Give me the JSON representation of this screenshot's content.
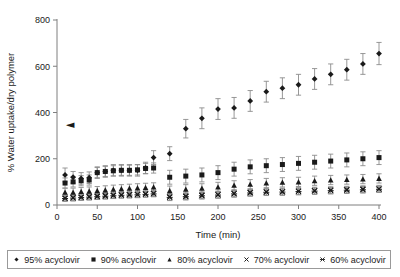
{
  "chart_data": {
    "type": "scatter",
    "title": "",
    "xlabel": "Time (min)",
    "ylabel": "% Water uptake/dry polymer",
    "xlim": [
      0,
      400
    ],
    "ylim": [
      0,
      800
    ],
    "xticks": [
      0,
      50,
      100,
      150,
      200,
      250,
      300,
      350,
      400
    ],
    "yticks": [
      0,
      200,
      400,
      600,
      800
    ],
    "grid": false,
    "legend_position": "bottom",
    "errorbars": true,
    "annotations": [
      {
        "name": "left-triangle-marker",
        "glyph": "◄",
        "x": 5,
        "y": 350
      }
    ],
    "series": [
      {
        "name": "95% acyclovir",
        "marker": "diamond",
        "color": "#1a1a1a",
        "x": [
          10,
          20,
          30,
          40,
          50,
          60,
          70,
          80,
          90,
          100,
          110,
          120,
          140,
          160,
          180,
          200,
          220,
          240,
          260,
          280,
          300,
          320,
          340,
          360,
          380,
          400
        ],
        "y": [
          130,
          120,
          115,
          118,
          140,
          145,
          150,
          150,
          150,
          150,
          160,
          205,
          222,
          330,
          375,
          415,
          420,
          450,
          490,
          505,
          520,
          545,
          565,
          585,
          610,
          655
        ],
        "yerr": [
          30,
          25,
          25,
          25,
          25,
          25,
          25,
          25,
          25,
          25,
          25,
          30,
          30,
          40,
          45,
          45,
          45,
          45,
          45,
          45,
          45,
          45,
          45,
          45,
          45,
          48
        ]
      },
      {
        "name": "90% acyclovir",
        "marker": "square",
        "color": "#1a1a1a",
        "x": [
          10,
          20,
          30,
          40,
          50,
          60,
          70,
          80,
          90,
          100,
          110,
          120,
          140,
          160,
          180,
          200,
          220,
          240,
          260,
          280,
          300,
          320,
          340,
          360,
          380,
          400
        ],
        "y": [
          95,
          100,
          105,
          108,
          140,
          145,
          148,
          150,
          150,
          152,
          158,
          160,
          120,
          125,
          130,
          140,
          155,
          165,
          170,
          175,
          180,
          185,
          190,
          195,
          200,
          205
        ],
        "yerr": [
          22,
          22,
          22,
          22,
          22,
          22,
          22,
          22,
          22,
          22,
          22,
          22,
          30,
          30,
          30,
          30,
          30,
          30,
          30,
          30,
          30,
          30,
          30,
          30,
          30,
          30
        ]
      },
      {
        "name": "80% acyclovir",
        "marker": "triangle",
        "color": "#1a1a1a",
        "x": [
          10,
          20,
          30,
          40,
          50,
          60,
          70,
          80,
          90,
          100,
          110,
          120,
          140,
          160,
          180,
          200,
          220,
          240,
          260,
          280,
          300,
          320,
          340,
          360,
          380,
          400
        ],
        "y": [
          55,
          55,
          58,
          60,
          62,
          65,
          68,
          70,
          72,
          74,
          76,
          78,
          62,
          68,
          72,
          78,
          85,
          90,
          95,
          98,
          100,
          105,
          108,
          110,
          112,
          115
        ],
        "yerr": [
          18,
          18,
          18,
          18,
          18,
          18,
          18,
          18,
          18,
          18,
          18,
          18,
          20,
          20,
          20,
          20,
          20,
          20,
          20,
          20,
          20,
          20,
          20,
          20,
          20,
          20
        ]
      },
      {
        "name": "70% acyclovir",
        "marker": "cross",
        "color": "#1a1a1a",
        "x": [
          10,
          20,
          30,
          40,
          50,
          60,
          70,
          80,
          90,
          100,
          110,
          120,
          140,
          160,
          180,
          200,
          220,
          240,
          260,
          280,
          300,
          320,
          340,
          360,
          380,
          400
        ],
        "y": [
          30,
          32,
          34,
          36,
          38,
          40,
          42,
          44,
          45,
          46,
          48,
          50,
          35,
          38,
          42,
          45,
          50,
          54,
          57,
          58,
          60,
          62,
          64,
          66,
          68,
          70
        ],
        "yerr": [
          14,
          14,
          14,
          14,
          14,
          14,
          14,
          14,
          14,
          14,
          14,
          14,
          15,
          15,
          15,
          15,
          15,
          15,
          15,
          15,
          15,
          15,
          15,
          15,
          15,
          15
        ]
      },
      {
        "name": "60% acyclovir",
        "marker": "asterisk",
        "color": "#1a1a1a",
        "x": [
          10,
          20,
          30,
          40,
          50,
          60,
          70,
          80,
          90,
          100,
          110,
          120,
          140,
          160,
          180,
          200,
          220,
          240,
          260,
          280,
          300,
          320,
          340,
          360,
          380,
          400
        ],
        "y": [
          28,
          30,
          32,
          34,
          36,
          38,
          40,
          42,
          43,
          44,
          46,
          48,
          33,
          36,
          40,
          43,
          48,
          52,
          55,
          56,
          58,
          60,
          62,
          64,
          66,
          68
        ],
        "yerr": [
          12,
          12,
          12,
          12,
          12,
          12,
          12,
          12,
          12,
          12,
          12,
          12,
          14,
          14,
          14,
          14,
          14,
          14,
          14,
          14,
          14,
          14,
          14,
          14,
          14,
          14
        ]
      }
    ]
  },
  "legend": {
    "items": [
      {
        "label": "95% acyclovir",
        "marker": "diamond"
      },
      {
        "label": "90% acyclovir",
        "marker": "square"
      },
      {
        "label": "80% acyclovir",
        "marker": "triangle"
      },
      {
        "label": "70% acyclovir",
        "marker": "cross"
      },
      {
        "label": "60% acyclovir",
        "marker": "asterisk"
      }
    ]
  }
}
